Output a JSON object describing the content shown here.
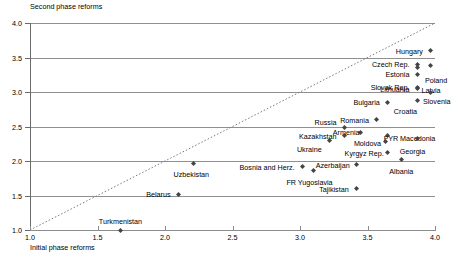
{
  "chart_data": {
    "type": "scatter",
    "title": "",
    "ylabel": "Second phase reforms",
    "xlabel": "Initial phase reforms",
    "xlim": [
      1.0,
      4.0
    ],
    "ylim": [
      1.0,
      4.0
    ],
    "xticks": [
      "1.0",
      "1.5",
      "2.0",
      "2.5",
      "3.0",
      "3.5",
      "4.0"
    ],
    "yticks": [
      "1.0",
      "1.5",
      "2.0",
      "2.5",
      "3.0",
      "3.5",
      "4.0"
    ],
    "grid": "horizontal",
    "legend": "none",
    "reference_line": {
      "type": "45-degree dotted diagonal",
      "from": [
        1.0,
        1.0
      ],
      "to": [
        4.0,
        4.0
      ]
    },
    "marker": "small-diamond",
    "points": [
      {
        "label": "Hungary",
        "x": 3.97,
        "y": 3.6,
        "lpos": "r",
        "ldx": -8,
        "ldy": 0
      },
      {
        "label": "Czech Rep.",
        "x": 3.87,
        "y": 3.4,
        "lpos": "r",
        "ldx": -8,
        "ldy": 0
      },
      {
        "label": "Poland",
        "x": 3.97,
        "y": 3.38,
        "lpos": "l",
        "ldx": -6,
        "ldy": 14
      },
      {
        "label": "Estonia",
        "x": 3.87,
        "y": 3.35,
        "lpos": "r",
        "ldx": -8,
        "ldy": 6
      },
      {
        "label": "Lithuania",
        "x": 3.87,
        "y": 3.25,
        "lpos": "r",
        "ldx": -8,
        "ldy": 14
      },
      {
        "label": "Slovak Rep.",
        "x": 3.87,
        "y": 3.07,
        "lpos": "r",
        "ldx": -8,
        "ldy": 0
      },
      {
        "label": "Latvia",
        "x": 3.87,
        "y": 3.05,
        "lpos": "l",
        "ldx": 4,
        "ldy": 1
      },
      {
        "label": "Slovenia",
        "x": 3.97,
        "y": 3.0,
        "lpos": "l",
        "ldx": -8,
        "ldy": 9
      },
      {
        "label": "Croatia",
        "x": 3.87,
        "y": 2.88,
        "lpos": "c",
        "ldx": -12,
        "ldy": 11
      },
      {
        "label": "Bulgaria",
        "x": 3.65,
        "y": 2.85,
        "lpos": "r",
        "ldx": -8,
        "ldy": 0
      },
      {
        "label": "Romania",
        "x": 3.57,
        "y": 2.6,
        "lpos": "r",
        "ldx": -8,
        "ldy": 0
      },
      {
        "label": "Russia",
        "x": 3.33,
        "y": 2.48,
        "lpos": "r",
        "ldx": -8,
        "ldy": -6
      },
      {
        "label": "Armenia",
        "x": 3.45,
        "y": 2.42,
        "lpos": "l",
        "ldx": -28,
        "ldy": 0
      },
      {
        "label": "FYR Macedonia",
        "x": 3.65,
        "y": 2.37,
        "lpos": "l",
        "ldx": -4,
        "ldy": 3
      },
      {
        "label": "Kazakhstan",
        "x": 3.33,
        "y": 2.37,
        "lpos": "r",
        "ldx": -8,
        "ldy": 1
      },
      {
        "label": "Georgia",
        "x": 3.87,
        "y": 2.32,
        "lpos": "c",
        "ldx": -5,
        "ldy": 12
      },
      {
        "label": "Ukraine",
        "x": 3.22,
        "y": 2.3,
        "lpos": "r",
        "ldx": -8,
        "ldy": 9
      },
      {
        "label": "Moldova",
        "x": 3.63,
        "y": 2.28,
        "lpos": "r",
        "ldx": -4,
        "ldy": 1
      },
      {
        "label": "Kyrgyz Rep.",
        "x": 3.65,
        "y": 2.13,
        "lpos": "r",
        "ldx": -4,
        "ldy": 1
      },
      {
        "label": "Albania",
        "x": 3.75,
        "y": 2.02,
        "lpos": "c",
        "ldx": 0,
        "ldy": 11
      },
      {
        "label": "Uzbekistan",
        "x": 2.21,
        "y": 1.97,
        "lpos": "c",
        "ldx": -2,
        "ldy": 11
      },
      {
        "label": "Azerbaijan",
        "x": 3.42,
        "y": 1.95,
        "lpos": "r",
        "ldx": -7,
        "ldy": 1
      },
      {
        "label": "Bosnia and Herz.",
        "x": 3.02,
        "y": 1.92,
        "lpos": "r",
        "ldx": -8,
        "ldy": 0
      },
      {
        "label": "FR Yugoslavia",
        "x": 3.1,
        "y": 1.86,
        "lpos": "c",
        "ldx": -4,
        "ldy": 11
      },
      {
        "label": "Tajikistan",
        "x": 3.42,
        "y": 1.6,
        "lpos": "r",
        "ldx": -8,
        "ldy": 0
      },
      {
        "label": "Belarus",
        "x": 2.1,
        "y": 1.51,
        "lpos": "r",
        "ldx": -8,
        "ldy": -1
      },
      {
        "label": "Turkmenistan",
        "x": 1.67,
        "y": 1.0,
        "lpos": "c",
        "ldx": 0,
        "ldy": -9
      }
    ]
  }
}
